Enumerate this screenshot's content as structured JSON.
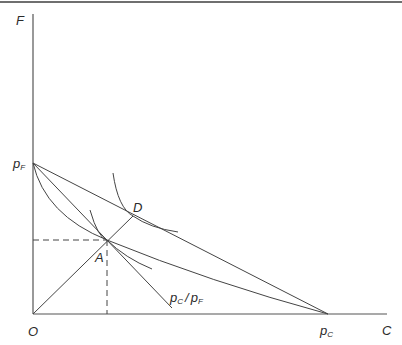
{
  "diagram": {
    "axes": {
      "y_label": "F",
      "x_label": "C",
      "origin_label": "O"
    },
    "intercepts": {
      "y_intercept_label": "p",
      "y_intercept_sub": "F",
      "x_intercept_label": "p",
      "x_intercept_sub": "C"
    },
    "points": {
      "A": "A",
      "D": "D"
    },
    "slope_label": {
      "num": "p",
      "num_sub": "C",
      "slash": "/",
      "den": "p",
      "den_sub": "F"
    },
    "colors": {
      "line": "#444444",
      "axis": "#555555",
      "frame": "#6f6f6f"
    }
  }
}
